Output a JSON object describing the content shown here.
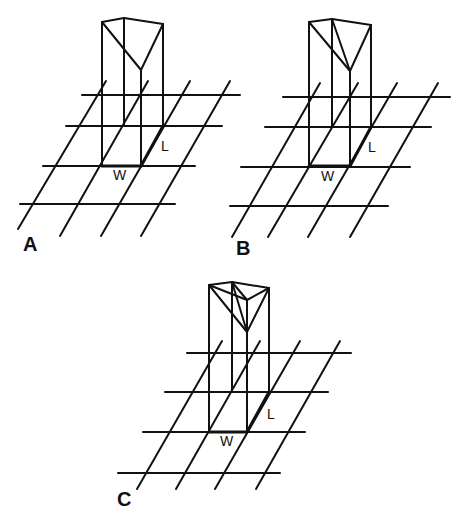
{
  "figure": {
    "panels": [
      {
        "id": "A",
        "label": "A",
        "dim_w": "W",
        "dim_l": "L",
        "description": "Rectangular column on grid with single diagonal fold on top face"
      },
      {
        "id": "B",
        "label": "B",
        "dim_w": "W",
        "dim_l": "L",
        "description": "Rectangular column on grid with two diagonal folds on top face"
      },
      {
        "id": "C",
        "label": "C",
        "dim_w": "W",
        "dim_l": "L",
        "description": "Rectangular column on grid with triangular pyramid-like top"
      }
    ],
    "colors": {
      "line": "#111111",
      "background": "#ffffff"
    }
  }
}
